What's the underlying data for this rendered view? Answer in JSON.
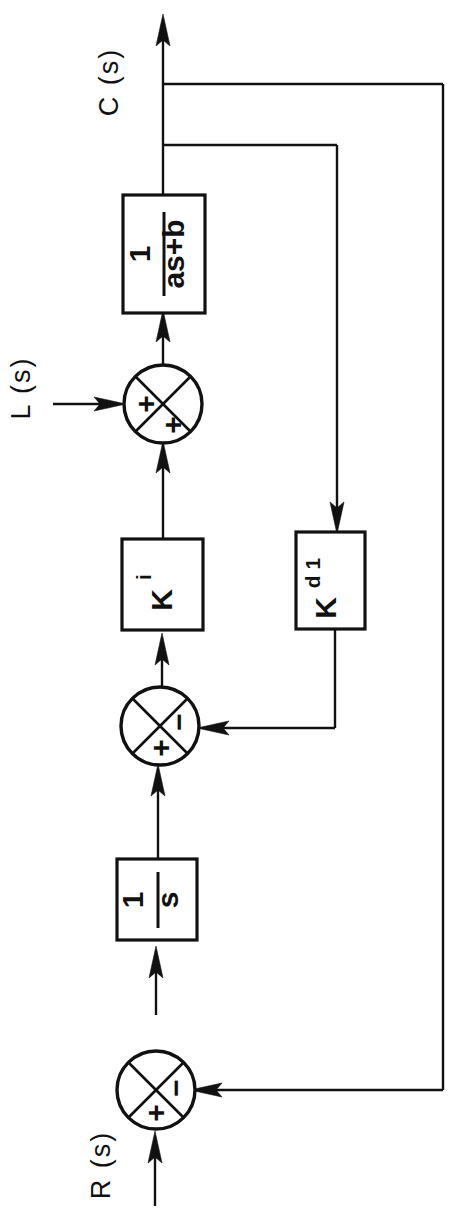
{
  "diagram": {
    "orientation": "rotated-90-ccw",
    "background_color": "#ffffff",
    "line_color": "#111111",
    "signals": {
      "output_label": "C (s)",
      "disturbance_label": "L (s)",
      "input_label": "R (s)"
    },
    "blocks": [
      {
        "id": "plant",
        "label_num": "1",
        "label_den": "as+b",
        "type": "fraction"
      },
      {
        "id": "gain-ki",
        "label_main": "K",
        "label_sub": "i",
        "type": "gain"
      },
      {
        "id": "gain-kd1",
        "label_main": "K",
        "label_sub": "d 1",
        "type": "gain"
      },
      {
        "id": "integrator",
        "label_num": "1",
        "label_den": "s",
        "type": "fraction"
      }
    ],
    "summing_junctions": [
      {
        "id": "sum-disturbance",
        "sign_a": "+",
        "sign_b": "+"
      },
      {
        "id": "sum-inner",
        "sign_a": "+",
        "sign_b": "−"
      },
      {
        "id": "sum-outer",
        "sign_a": "+",
        "sign_b": "−"
      }
    ]
  }
}
